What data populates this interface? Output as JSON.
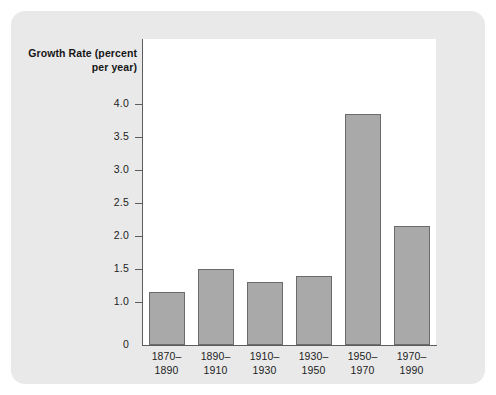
{
  "chart_data": {
    "type": "bar",
    "title": "",
    "xlabel": "",
    "ylabel": "Growth Rate (percent per year)",
    "ylabel_lines": [
      "Growth Rate",
      "(percent",
      "per year)"
    ],
    "categories": [
      "1870–1890",
      "1890–1910",
      "1910–1930",
      "1930–1950",
      "1950–1970",
      "1970–1990"
    ],
    "category_lines": [
      [
        "1870–",
        "1890"
      ],
      [
        "1890–",
        "1910"
      ],
      [
        "1910–",
        "1930"
      ],
      [
        "1930–",
        "1950"
      ],
      [
        "1950–",
        "1970"
      ],
      [
        "1970–",
        "1990"
      ]
    ],
    "values": [
      1.15,
      1.5,
      1.3,
      1.4,
      3.85,
      2.15
    ],
    "ytick_labels": [
      "4.0",
      "3.5",
      "3.0",
      "2.5",
      "2.0",
      "1.5",
      "1.0",
      "0"
    ],
    "ytick_values": [
      4.0,
      3.5,
      3.0,
      2.5,
      2.0,
      1.5,
      1.0,
      0
    ],
    "ylim": [
      0,
      4.25
    ],
    "axis_break": true,
    "grid": false,
    "legend": null
  },
  "style": {
    "figure_background": "#e9e9e9",
    "page_background": "#ffffff",
    "plot_background": "#ffffff",
    "bar_fill": "#a9a9a9",
    "bar_border": "#6b6b6b",
    "axis_color": "#5d5d5d",
    "text_color": "#1d1d1d"
  }
}
